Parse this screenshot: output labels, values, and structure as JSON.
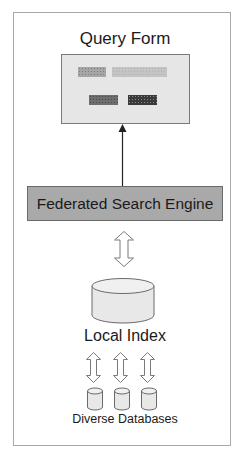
{
  "diagram": {
    "query_form": {
      "title": "Query Form",
      "fields": [
        "field-label-placeholder",
        "field-input-placeholder"
      ],
      "buttons": [
        "button-placeholder-1",
        "button-placeholder-2"
      ]
    },
    "engine": {
      "label": "Federated Search Engine"
    },
    "local_index": {
      "label": "Local Index"
    },
    "databases": {
      "label": "Diverse Databases",
      "count": 3
    },
    "connections": [
      {
        "from": "Federated Search Engine",
        "to": "Query Form",
        "type": "single-arrow"
      },
      {
        "from": "Federated Search Engine",
        "to": "Local Index",
        "type": "bidirectional"
      },
      {
        "from": "Local Index",
        "to": "Diverse Databases",
        "type": "bidirectional",
        "count": 3
      }
    ],
    "colors": {
      "frame_border": "#a8a8a8",
      "form_fill": "#e6e6e6",
      "engine_fill": "#a9a9a9",
      "cylinder_fill": "#e8e8e8",
      "text": "#1a1a1a"
    }
  }
}
